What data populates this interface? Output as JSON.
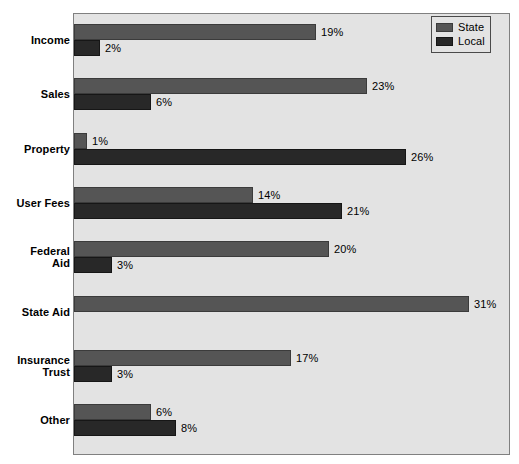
{
  "chart_data": {
    "type": "bar",
    "orientation": "horizontal",
    "title": "",
    "xlabel": "",
    "ylabel": "",
    "xlim": [
      0,
      34
    ],
    "grid": false,
    "legend_position": "top-right",
    "categories": [
      "Income",
      "Sales",
      "Property",
      "User Fees",
      "Federal\nAid",
      "State Aid",
      "Insurance\nTrust",
      "Other"
    ],
    "series": [
      {
        "name": "State",
        "color": "#555555",
        "values": [
          19,
          23,
          1,
          14,
          20,
          31,
          17,
          6
        ],
        "labels": [
          "19%",
          "23%",
          "1%",
          "14%",
          "20%",
          "31%",
          "17%",
          "6%"
        ]
      },
      {
        "name": "Local",
        "color": "#282828",
        "values": [
          2,
          6,
          26,
          21,
          3,
          0,
          3,
          8
        ],
        "labels": [
          "2%",
          "6%",
          "26%",
          "21%",
          "3%",
          "",
          "3%",
          "8%"
        ]
      }
    ]
  },
  "axis": {
    "labels": [
      {
        "line1": "Income",
        "line2": ""
      },
      {
        "line1": "Sales",
        "line2": ""
      },
      {
        "line1": "Property",
        "line2": ""
      },
      {
        "line1": "User Fees",
        "line2": ""
      },
      {
        "line1": "Federal",
        "line2": "Aid"
      },
      {
        "line1": "State Aid",
        "line2": ""
      },
      {
        "line1": "Insurance",
        "line2": "Trust"
      },
      {
        "line1": "Other",
        "line2": ""
      }
    ]
  },
  "legend": {
    "items": [
      {
        "label": "State",
        "color": "#555555"
      },
      {
        "label": "Local",
        "color": "#282828"
      }
    ]
  },
  "bars": [
    {
      "category": "Income",
      "series": "State",
      "value_label": "19%"
    },
    {
      "category": "Income",
      "series": "Local",
      "value_label": "2%"
    },
    {
      "category": "Sales",
      "series": "State",
      "value_label": "23%"
    },
    {
      "category": "Sales",
      "series": "Local",
      "value_label": "6%"
    },
    {
      "category": "Property",
      "series": "State",
      "value_label": "1%"
    },
    {
      "category": "Property",
      "series": "Local",
      "value_label": "26%"
    },
    {
      "category": "User Fees",
      "series": "State",
      "value_label": "14%"
    },
    {
      "category": "User Fees",
      "series": "Local",
      "value_label": "21%"
    },
    {
      "category": "Federal Aid",
      "series": "State",
      "value_label": "20%"
    },
    {
      "category": "Federal Aid",
      "series": "Local",
      "value_label": "3%"
    },
    {
      "category": "State Aid",
      "series": "State",
      "value_label": "31%"
    },
    {
      "category": "Insurance Trust",
      "series": "State",
      "value_label": "17%"
    },
    {
      "category": "Insurance Trust",
      "series": "Local",
      "value_label": "3%"
    },
    {
      "category": "Other",
      "series": "State",
      "value_label": "6%"
    },
    {
      "category": "Other",
      "series": "Local",
      "value_label": "8%"
    }
  ]
}
